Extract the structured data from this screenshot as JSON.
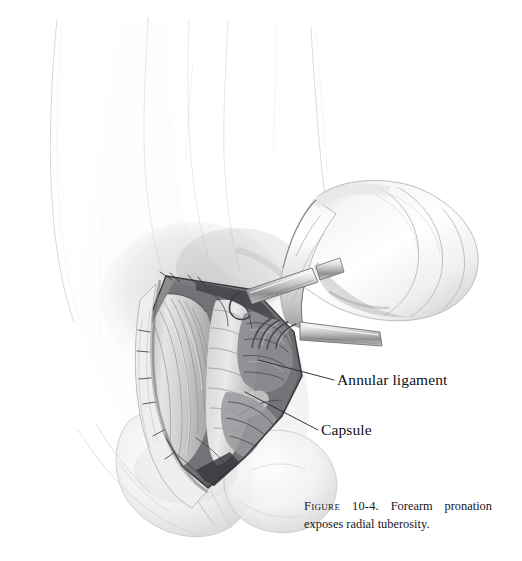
{
  "figure": {
    "background_color": "#ffffff",
    "medium": "graphite pencil surgical illustration"
  },
  "labels": [
    {
      "id": "annular-ligament",
      "text": "Annular ligament",
      "leader_from": [
        259,
        361
      ],
      "leader_to": [
        334,
        380
      ]
    },
    {
      "id": "capsule",
      "text": "Capsule",
      "leader_from": [
        246,
        392
      ],
      "leader_to": [
        318,
        430
      ]
    }
  ],
  "caption": {
    "figure_word": "Figure",
    "number": "10-4.",
    "text": "Forearm pronation exposes radial tuberosity."
  },
  "colors": {
    "ink": "#111014",
    "caption_ink": "#17161a",
    "leader_line": "#2b2a2e",
    "faint_outline": "#c9c9cd",
    "mid_gray": "#9a9aa0",
    "shadow_gray": "#6e6e74",
    "deep_shadow": "#3c3b40",
    "skin_light": "#f4f3f2",
    "skin_shade": "#dedddc",
    "tissue_gray": "#b3b2b4"
  },
  "anatomy_parts": [
    "upper arm (faint contour)",
    "antecubital fossa",
    "open surgical incision",
    "retracted muscle belly",
    "supinator / extensor mass",
    "annular ligament",
    "joint capsule",
    "radial tuberosity",
    "pronated distal forearm and hand",
    "multi-prong rake retractor"
  ]
}
